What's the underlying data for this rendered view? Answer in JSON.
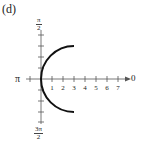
{
  "panel_label": "(d)",
  "axes": {
    "angle_labels": {
      "right": "0",
      "left": "π",
      "top": {
        "num": "π",
        "den": "2"
      },
      "bottom": {
        "num": "3π",
        "den": "2"
      }
    },
    "polar_axis_ticks": [
      "1",
      "2",
      "3",
      "4",
      "5",
      "6",
      "7"
    ]
  },
  "curve": {
    "description": "left half of circle centered at (3,0) with radius 3",
    "center": [
      3,
      0
    ],
    "radius": 3,
    "color": "#111111"
  }
}
